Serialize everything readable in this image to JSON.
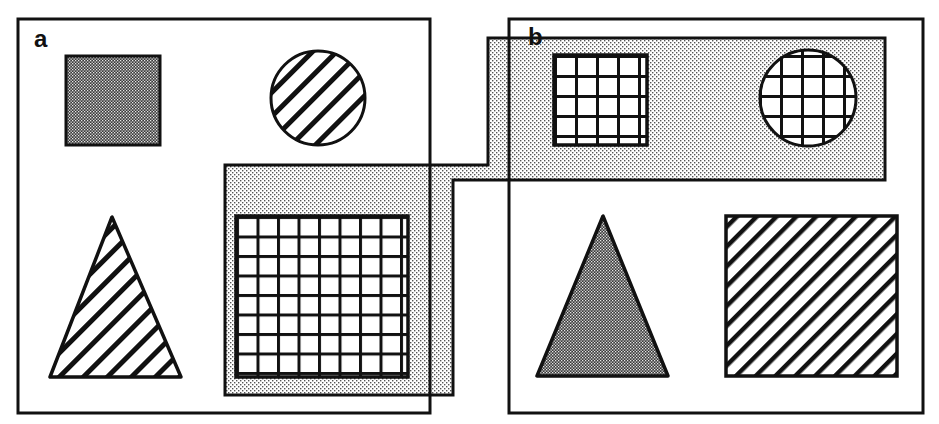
{
  "figure": {
    "colors": {
      "stroke": "#111111",
      "background": "#ffffff",
      "light_stipple": "#c8c8c8",
      "dark_stipple": "#6e6e6e"
    }
  },
  "panels": [
    {
      "label": "a",
      "items": [
        {
          "shape": "square",
          "texture": "dark-stipple",
          "position": "top-left"
        },
        {
          "shape": "circle",
          "texture": "diagonal-hatch",
          "position": "top-right"
        },
        {
          "shape": "triangle",
          "texture": "diagonal-hatch",
          "position": "bottom-left"
        },
        {
          "shape": "square",
          "texture": "grid",
          "position": "bottom-right",
          "grouped": true
        }
      ]
    },
    {
      "label": "b",
      "items": [
        {
          "shape": "square",
          "texture": "grid",
          "position": "top-left",
          "grouped": true
        },
        {
          "shape": "circle",
          "texture": "grid",
          "position": "top-right",
          "grouped": true
        },
        {
          "shape": "triangle",
          "texture": "dark-stipple",
          "position": "bottom-left"
        },
        {
          "shape": "square",
          "texture": "diagonal-hatch",
          "position": "bottom-right"
        }
      ]
    }
  ],
  "grouping_region": {
    "texture": "light-stipple",
    "spans_panels": [
      "a",
      "b"
    ]
  }
}
